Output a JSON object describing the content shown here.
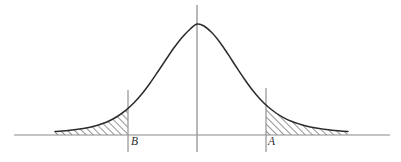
{
  "figure": {
    "type": "statistical-diagram",
    "width": 401,
    "height": 162,
    "background_color": "#ffffff"
  },
  "labels": {
    "left_bound": "B",
    "right_bound": "A"
  },
  "colors": {
    "curve": "#2b2b2b",
    "axis": "#8a8a8a",
    "vline": "#9a9a9a",
    "hatch": "#3a3a3a",
    "label": "#2b2b2b"
  },
  "chart_data": {
    "type": "line",
    "title": "",
    "subtitle": "",
    "xlabel": "",
    "ylabel": "",
    "grid": false,
    "legend": null,
    "curve_name": "normal-probability-density",
    "axis_baseline_y": 135,
    "axis_x_start": 14,
    "axis_x_end": 390,
    "peak": {
      "x": 197,
      "y": 24
    },
    "center_line_x": 197,
    "center_line_top": 5,
    "center_line_bottom": 152,
    "markers": [
      {
        "name": "B",
        "label": "B",
        "x": 128,
        "line_top": 90,
        "line_bottom": 152,
        "label_x": 131,
        "label_y": 137
      },
      {
        "name": "A",
        "label": "A",
        "x": 266,
        "line_top": 88,
        "line_bottom": 152,
        "label_x": 268,
        "label_y": 137
      }
    ],
    "shaded_regions": [
      {
        "name": "left-tail",
        "from_x": 55,
        "to_x": 128,
        "hatched": true,
        "hatch_angle_deg": 45
      },
      {
        "name": "right-tail",
        "from_x": 266,
        "to_x": 348,
        "hatched": true,
        "hatch_angle_deg": 45
      }
    ],
    "curve_points": [
      {
        "x": 55,
        "y": 131.5
      },
      {
        "x": 62,
        "y": 131.0
      },
      {
        "x": 70,
        "y": 130.2
      },
      {
        "x": 78,
        "y": 129.2
      },
      {
        "x": 86,
        "y": 128.0
      },
      {
        "x": 94,
        "y": 126.2
      },
      {
        "x": 102,
        "y": 123.8
      },
      {
        "x": 110,
        "y": 120.5
      },
      {
        "x": 118,
        "y": 116.0
      },
      {
        "x": 126,
        "y": 110.2
      },
      {
        "x": 134,
        "y": 102.8
      },
      {
        "x": 142,
        "y": 93.8
      },
      {
        "x": 150,
        "y": 83.2
      },
      {
        "x": 158,
        "y": 71.5
      },
      {
        "x": 166,
        "y": 59.5
      },
      {
        "x": 174,
        "y": 47.8
      },
      {
        "x": 182,
        "y": 37.5
      },
      {
        "x": 190,
        "y": 29.2
      },
      {
        "x": 197,
        "y": 24.0
      },
      {
        "x": 204,
        "y": 26.0
      },
      {
        "x": 212,
        "y": 32.8
      },
      {
        "x": 220,
        "y": 42.5
      },
      {
        "x": 228,
        "y": 54.2
      },
      {
        "x": 236,
        "y": 66.5
      },
      {
        "x": 244,
        "y": 78.5
      },
      {
        "x": 252,
        "y": 89.5
      },
      {
        "x": 260,
        "y": 99.0
      },
      {
        "x": 268,
        "y": 106.8
      },
      {
        "x": 276,
        "y": 113.0
      },
      {
        "x": 284,
        "y": 117.8
      },
      {
        "x": 292,
        "y": 121.5
      },
      {
        "x": 300,
        "y": 124.2
      },
      {
        "x": 308,
        "y": 126.4
      },
      {
        "x": 316,
        "y": 128.0
      },
      {
        "x": 324,
        "y": 129.2
      },
      {
        "x": 332,
        "y": 130.2
      },
      {
        "x": 340,
        "y": 130.9
      },
      {
        "x": 348,
        "y": 131.5
      }
    ]
  }
}
